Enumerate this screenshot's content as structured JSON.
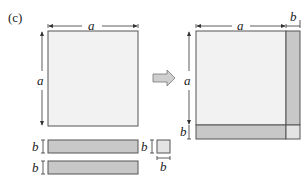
{
  "panel_label": "(c)",
  "labels": {
    "a": "a",
    "b": "b"
  },
  "colors": {
    "light_fill": "#f2f2f2",
    "dark_fill": "#c8c8c8",
    "corner_fill": "#e4e4e4",
    "stroke": "#555555",
    "arrow_fill": "#cfcfcf"
  },
  "left_figure": {
    "square_side_label": "a",
    "square_height_label": "a",
    "strips": [
      {
        "height_label": "b"
      },
      {
        "height_label": "b"
      }
    ],
    "small_square": {
      "height_label": "b",
      "width_label": "b"
    }
  },
  "right_figure": {
    "top_labels": [
      "a",
      "b"
    ],
    "left_labels": [
      "a",
      "b"
    ]
  }
}
